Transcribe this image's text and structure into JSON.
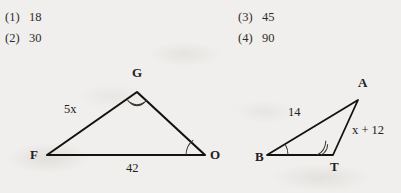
{
  "answer_choices": {
    "left_column": [
      {
        "number": "(1)",
        "value": "18"
      },
      {
        "number": "(2)",
        "value": "30"
      }
    ],
    "right_column": [
      {
        "number": "(3)",
        "value": "45"
      },
      {
        "number": "(4)",
        "value": "90"
      }
    ]
  },
  "figures": [
    {
      "name": "triangle-FGO",
      "vertices": [
        {
          "label": "F",
          "x": 47,
          "y": 155
        },
        {
          "label": "G",
          "x": 137,
          "y": 92
        },
        {
          "label": "O",
          "x": 205,
          "y": 155
        }
      ],
      "side_labels": [
        {
          "label": "5x",
          "side": "FG"
        },
        {
          "label": "42",
          "side": "FO"
        }
      ],
      "angle_marks": [
        {
          "vertex": "G",
          "arcs": 2
        },
        {
          "vertex": "O",
          "arcs": 1
        }
      ]
    },
    {
      "name": "triangle-BAT",
      "vertices": [
        {
          "label": "B",
          "x": 267,
          "y": 155
        },
        {
          "label": "A",
          "x": 358,
          "y": 100
        },
        {
          "label": "T",
          "x": 333,
          "y": 155
        }
      ],
      "side_labels": [
        {
          "label": "14",
          "side": "BA"
        },
        {
          "label": "x + 12",
          "side": "AT"
        }
      ],
      "angle_marks": [
        {
          "vertex": "B",
          "arcs": 1
        },
        {
          "vertex": "T",
          "arcs": 2
        }
      ]
    }
  ],
  "colors": {
    "paper": "#f1efed",
    "ink": "#2b2b2b",
    "stroke": "#14120f",
    "arc": "#3a3734"
  }
}
